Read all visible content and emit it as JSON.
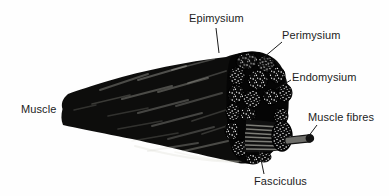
{
  "figure": {
    "labels": {
      "muscle": "Muscle",
      "epimysium": "Epimysium",
      "perimysium": "Perimysium",
      "endomysium": "Endomysium",
      "muscle_fibres": "Muscle fibres",
      "fasciculus": "Fasciculus"
    },
    "colors": {
      "background": "#fefefe",
      "ink": "#1c1c1c",
      "muscle_body": "#0d0d0c",
      "cut_face": "#050505",
      "speckle": "#ffffff",
      "striation": "#90908a",
      "fibre_rod": "#6e6e6a"
    }
  }
}
